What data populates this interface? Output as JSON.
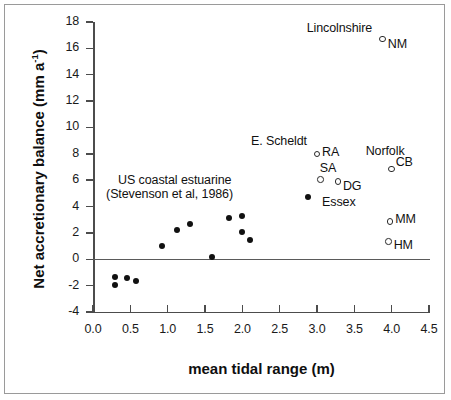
{
  "chart_data": {
    "type": "scatter",
    "title": "",
    "xlabel": "mean tidal range (m)",
    "ylabel": "Net accretionary balance (mm a-1)",
    "ylabel_base": "Net accretionary balance (mm a",
    "ylabel_sup": "-1",
    "ylabel_tail": ")",
    "xlim": [
      0.0,
      4.5
    ],
    "ylim": [
      -4,
      18
    ],
    "xticks": [
      "0.0",
      "0.5",
      "1.0",
      "1.5",
      "2.0",
      "2.5",
      "3.0",
      "3.5",
      "4.0",
      "4.5"
    ],
    "xtick_values": [
      0.0,
      0.5,
      1.0,
      1.5,
      2.0,
      2.5,
      3.0,
      3.5,
      4.0,
      4.5
    ],
    "yticks": [
      "18",
      "16",
      "14",
      "12",
      "10",
      "8",
      "6",
      "4",
      "2",
      "0",
      "-2",
      "-4"
    ],
    "ytick_values": [
      18,
      16,
      14,
      12,
      10,
      8,
      6,
      4,
      2,
      0,
      -2,
      -4
    ],
    "grid": false,
    "zero_line": true,
    "legend": "none",
    "series": [
      {
        "name": "US coastal estuarine (Stevenson et al, 1986)",
        "marker": "filled-circle",
        "points": [
          {
            "x": 0.3,
            "y": -1.35
          },
          {
            "x": 0.3,
            "y": -1.95
          },
          {
            "x": 0.45,
            "y": -1.4
          },
          {
            "x": 0.57,
            "y": -1.65
          },
          {
            "x": 0.92,
            "y": 1.0
          },
          {
            "x": 1.12,
            "y": 2.25
          },
          {
            "x": 1.3,
            "y": 2.7
          },
          {
            "x": 1.6,
            "y": 0.15
          },
          {
            "x": 1.82,
            "y": 3.15
          },
          {
            "x": 2.0,
            "y": 3.25
          },
          {
            "x": 2.0,
            "y": 2.1
          },
          {
            "x": 2.1,
            "y": 1.5
          }
        ]
      },
      {
        "name": "Essex",
        "marker": "filled-circle",
        "points": [
          {
            "x": 2.88,
            "y": 4.7,
            "label": "Essex"
          }
        ]
      },
      {
        "name": "European / UK marsh sites",
        "marker": "open-circle",
        "points": [
          {
            "x": 3.88,
            "y": 16.7,
            "label": "NM",
            "group": "Lincolnshire"
          },
          {
            "x": 3.0,
            "y": 8.0,
            "label": "RA",
            "group": "E. Scheldt"
          },
          {
            "x": 3.05,
            "y": 6.05,
            "label": "SA",
            "group": "E. Scheldt"
          },
          {
            "x": 3.28,
            "y": 5.9,
            "label": "DG",
            "group": "E. Scheldt"
          },
          {
            "x": 4.0,
            "y": 6.85,
            "label": "CB",
            "group": "Norfolk"
          },
          {
            "x": 3.98,
            "y": 2.85,
            "label": "MM"
          },
          {
            "x": 3.96,
            "y": 1.35,
            "label": "HM"
          }
        ]
      }
    ],
    "annotations": [
      {
        "name": "lincolnshire",
        "text": "Lincolnshire"
      },
      {
        "name": "e-scheldt",
        "text": "E. Scheldt"
      },
      {
        "name": "norfolk",
        "text": "Norfolk"
      },
      {
        "name": "essex",
        "text": "Essex"
      },
      {
        "name": "us-coastal-line1",
        "text": "US coastal estuarine"
      },
      {
        "name": "us-coastal-line2",
        "text": "(Stevenson et al, 1986)"
      },
      {
        "name": "point-nm",
        "text": "NM"
      },
      {
        "name": "point-ra",
        "text": "RA"
      },
      {
        "name": "point-sa",
        "text": "SA"
      },
      {
        "name": "point-dg",
        "text": "DG"
      },
      {
        "name": "point-cb",
        "text": "CB"
      },
      {
        "name": "point-mm",
        "text": "MM"
      },
      {
        "name": "point-hm",
        "text": "HM"
      }
    ]
  },
  "colors": {
    "axis": "#4c4c4c",
    "marker_filled": "#111111",
    "marker_open_stroke": "#2a2a2a",
    "text": "#111111",
    "border": "#9a9a9a",
    "background": "#ffffff"
  }
}
